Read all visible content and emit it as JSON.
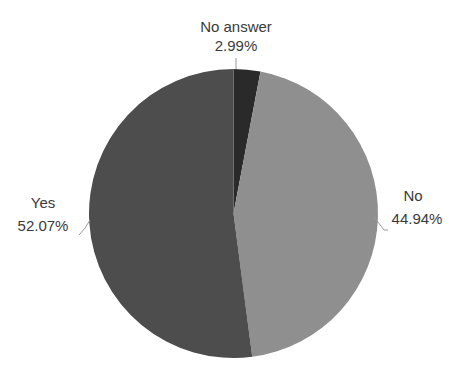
{
  "chart_data": {
    "type": "pie",
    "title": "",
    "categories": [
      "No answer",
      "No",
      "Yes"
    ],
    "values": [
      2.99,
      44.94,
      52.07
    ],
    "labels": [
      "No answer\n2.99%",
      "No\n44.94%",
      "Yes\n52.07%"
    ],
    "colors": [
      "#2a2a2a",
      "#8f8f8f",
      "#4d4d4d"
    ],
    "start_angle_deg": 0,
    "direction": "clockwise",
    "legend": "none",
    "data_labels": "outside with leader lines"
  },
  "labels": {
    "no_answer": {
      "name": "No answer",
      "pct": "2.99%"
    },
    "no": {
      "name": "No",
      "pct": "44.94%"
    },
    "yes": {
      "name": "Yes",
      "pct": "52.07%"
    }
  }
}
